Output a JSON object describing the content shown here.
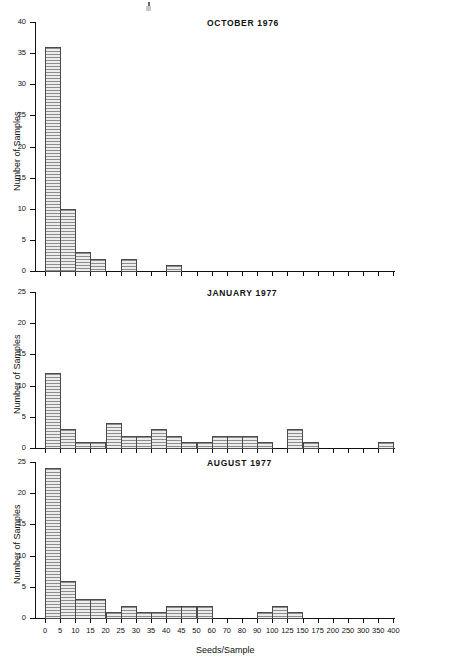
{
  "figure": {
    "xlabel": "Seeds/Sample",
    "ylabel": "Number of Samples"
  },
  "chart_data": [
    {
      "type": "bar",
      "title": "OCTOBER 1976",
      "xlabel": "Seeds/Sample",
      "ylabel": "Number of Samples",
      "ylim": [
        0,
        40
      ],
      "yticks": [
        0,
        5,
        10,
        15,
        20,
        25,
        30,
        35,
        40
      ],
      "grid": false,
      "bin_edges": [
        0,
        5,
        10,
        15,
        20,
        25,
        30,
        35,
        40,
        45,
        50,
        60,
        70,
        80,
        90,
        100,
        125,
        150,
        175,
        200,
        250,
        300,
        350,
        400
      ],
      "categories": [
        "0-5",
        "5-10",
        "10-15",
        "15-20",
        "20-25",
        "25-30",
        "30-35",
        "35-40",
        "40-45",
        "45-50",
        "50-60",
        "60-70",
        "70-80",
        "80-90",
        "90-100",
        "100-125",
        "125-150",
        "150-175",
        "175-200",
        "200-250",
        "250-300",
        "300-350",
        "350-400"
      ],
      "values": [
        36,
        10,
        3,
        2,
        0,
        2,
        0,
        0,
        1,
        0,
        0,
        0,
        0,
        0,
        0,
        0,
        0,
        0,
        0,
        0,
        0,
        0,
        0
      ]
    },
    {
      "type": "bar",
      "title": "JANUARY 1977",
      "xlabel": "Seeds/Sample",
      "ylabel": "Number of Samples",
      "ylim": [
        0,
        25
      ],
      "yticks": [
        0,
        5,
        10,
        15,
        20,
        25
      ],
      "grid": false,
      "bin_edges": [
        0,
        5,
        10,
        15,
        20,
        25,
        30,
        35,
        40,
        45,
        50,
        60,
        70,
        80,
        90,
        100,
        125,
        150,
        175,
        200,
        250,
        300,
        350,
        400
      ],
      "categories": [
        "0-5",
        "5-10",
        "10-15",
        "15-20",
        "20-25",
        "25-30",
        "30-35",
        "35-40",
        "40-45",
        "45-50",
        "50-60",
        "60-70",
        "70-80",
        "80-90",
        "90-100",
        "100-125",
        "125-150",
        "150-175",
        "175-200",
        "200-250",
        "250-300",
        "300-350",
        "350-400"
      ],
      "values": [
        12,
        3,
        1,
        1,
        4,
        2,
        2,
        3,
        2,
        1,
        1,
        2,
        2,
        2,
        1,
        0,
        3,
        1,
        0,
        0,
        0,
        0,
        1
      ]
    },
    {
      "type": "bar",
      "title": "AUGUST 1977",
      "xlabel": "Seeds/Sample",
      "ylabel": "Number of Samples",
      "ylim": [
        0,
        25
      ],
      "yticks": [
        0,
        5,
        10,
        15,
        20,
        25
      ],
      "grid": false,
      "bin_edges": [
        0,
        5,
        10,
        15,
        20,
        25,
        30,
        35,
        40,
        45,
        50,
        60,
        70,
        80,
        90,
        100,
        125,
        150,
        175,
        200,
        250,
        300,
        350,
        400
      ],
      "categories": [
        "0-5",
        "5-10",
        "10-15",
        "15-20",
        "20-25",
        "25-30",
        "30-35",
        "35-40",
        "40-45",
        "45-50",
        "50-60",
        "60-70",
        "70-80",
        "80-90",
        "90-100",
        "100-125",
        "125-150",
        "150-175",
        "175-200",
        "200-250",
        "250-300",
        "300-350",
        "350-400"
      ],
      "values": [
        24,
        6,
        3,
        3,
        1,
        2,
        1,
        1,
        2,
        2,
        2,
        0,
        0,
        0,
        1,
        2,
        1,
        0,
        0,
        0,
        0,
        0,
        0
      ]
    }
  ],
  "xtick_labels": [
    "0",
    "5",
    "10",
    "15",
    "20",
    "25",
    "30",
    "35",
    "40",
    "45",
    "50",
    "60",
    "70",
    "80",
    "90",
    "100",
    "125",
    "150",
    "175",
    "200",
    "250",
    "300",
    "350",
    "400"
  ]
}
